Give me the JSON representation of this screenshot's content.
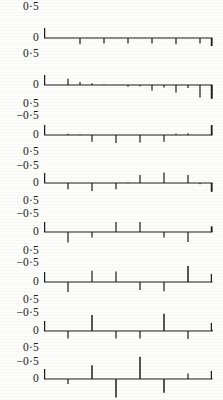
{
  "figure": {
    "type": "multi-panel-stem-plot",
    "panel_count": 8,
    "background_color": "#fdfdfb",
    "ink_color": "#1c1c1c",
    "y_tick_labels": [
      "0·5",
      "0",
      "−0·5"
    ],
    "y_tick_label_top": "0·5",
    "y_tick_label_zero": "0",
    "y_tick_label_bottom": "−0·5",
    "axis_origin_x": 44,
    "axis_end_x": 212
  },
  "chart_data": [
    {
      "type": "bar",
      "title": "Panel 1",
      "xlabel": "",
      "ylabel": "",
      "ylim": [
        -0.5,
        0.5
      ],
      "ytick_values": [
        0.5,
        0,
        -0.5
      ],
      "ytick_labels": [
        "0·5",
        "0",
        "−0·5"
      ],
      "grid": false,
      "legend": "none",
      "show_negative_axis": false,
      "x": [
        1,
        2,
        3,
        4,
        5,
        6,
        7,
        8,
        9,
        10,
        11,
        12,
        13,
        14
      ],
      "values": [
        0.0,
        0.0,
        -0.1,
        0.0,
        -0.09,
        0.0,
        -0.09,
        0.0,
        -0.09,
        0.0,
        -0.1,
        0.0,
        -0.09,
        -0.13
      ]
    },
    {
      "type": "bar",
      "title": "Panel 2",
      "xlabel": "",
      "ylabel": "",
      "ylim": [
        -0.5,
        0.5
      ],
      "ytick_values": [
        0.5,
        0,
        -0.5
      ],
      "ytick_labels": [
        "0·5",
        "0",
        "−0·5"
      ],
      "grid": false,
      "legend": "none",
      "show_negative_axis": true,
      "x": [
        1,
        2,
        3,
        4,
        5,
        6,
        7,
        8,
        9,
        10,
        11,
        12,
        13,
        14
      ],
      "values": [
        0.0,
        0.1,
        0.05,
        0.03,
        0.01,
        0.0,
        -0.03,
        -0.02,
        -0.09,
        -0.04,
        -0.12,
        -0.05,
        -0.2,
        -0.22
      ]
    },
    {
      "type": "bar",
      "title": "Panel 3",
      "xlabel": "",
      "ylabel": "",
      "ylim": [
        -0.5,
        0.5
      ],
      "ytick_values": [
        0.5,
        0,
        -0.5
      ],
      "ytick_labels": [
        "0·5",
        "0",
        "−0·5"
      ],
      "grid": false,
      "legend": "none",
      "show_negative_axis": true,
      "x": [
        1,
        2,
        3,
        4,
        5,
        6,
        7,
        8,
        9,
        10,
        11,
        12,
        13,
        14
      ],
      "values": [
        0.0,
        0.02,
        0.01,
        -0.11,
        0.0,
        -0.13,
        0.0,
        -0.12,
        0.0,
        -0.11,
        0.02,
        0.03,
        0.0,
        0.16
      ]
    },
    {
      "type": "bar",
      "title": "Panel 4",
      "xlabel": "",
      "ylabel": "",
      "ylim": [
        -0.5,
        0.5
      ],
      "ytick_values": [
        0.5,
        0,
        -0.5
      ],
      "ytick_labels": [
        "0·5",
        "0",
        "−0·5"
      ],
      "grid": false,
      "legend": "none",
      "show_negative_axis": true,
      "x": [
        1,
        2,
        3,
        4,
        5,
        6,
        7,
        8,
        9,
        10,
        11,
        12,
        13,
        14
      ],
      "values": [
        0.0,
        -0.1,
        0.0,
        -0.13,
        0.0,
        -0.1,
        0.01,
        0.13,
        0.0,
        0.17,
        0.0,
        0.13,
        -0.02,
        -0.14
      ]
    },
    {
      "type": "bar",
      "title": "Panel 5",
      "xlabel": "",
      "ylabel": "",
      "ylim": [
        -0.5,
        0.5
      ],
      "ytick_values": [
        0.5,
        0,
        -0.5
      ],
      "ytick_labels": [
        "0·5",
        "0",
        "−0·5"
      ],
      "grid": false,
      "legend": "none",
      "show_negative_axis": true,
      "x": [
        1,
        2,
        3,
        4,
        5,
        6,
        7,
        8,
        9,
        10,
        11,
        12,
        13,
        14
      ],
      "values": [
        0.0,
        -0.17,
        0.0,
        -0.09,
        0.0,
        0.16,
        0.0,
        0.16,
        0.0,
        -0.09,
        0.0,
        -0.16,
        0.0,
        0.09
      ]
    },
    {
      "type": "bar",
      "title": "Panel 6",
      "xlabel": "",
      "ylabel": "",
      "ylim": [
        -0.5,
        0.5
      ],
      "ytick_values": [
        0.5,
        0,
        -0.5
      ],
      "ytick_labels": [
        "0·5",
        "0",
        "−0·5"
      ],
      "grid": false,
      "legend": "none",
      "show_negative_axis": true,
      "x": [
        1,
        2,
        3,
        4,
        5,
        6,
        7,
        8,
        9,
        10,
        11,
        12,
        13,
        14
      ],
      "values": [
        0.0,
        -0.16,
        0.0,
        0.18,
        0.0,
        0.17,
        0.0,
        -0.13,
        0.0,
        -0.15,
        0.0,
        0.26,
        0.0,
        0.0
      ]
    },
    {
      "type": "bar",
      "title": "Panel 7",
      "xlabel": "",
      "ylabel": "",
      "ylim": [
        -0.5,
        0.5
      ],
      "ytick_values": [
        0.5,
        0,
        -0.5
      ],
      "ytick_labels": [
        "0·5",
        "0",
        "−0·5"
      ],
      "grid": false,
      "legend": "none",
      "show_negative_axis": true,
      "x": [
        1,
        2,
        3,
        4,
        5,
        6,
        7,
        8,
        9,
        10,
        11,
        12,
        13,
        14
      ],
      "values": [
        0.0,
        -0.12,
        0.0,
        0.26,
        0.0,
        -0.12,
        0.0,
        -0.12,
        0.0,
        0.28,
        0.0,
        -0.13,
        0.0,
        0.02
      ]
    },
    {
      "type": "bar",
      "title": "Panel 8",
      "xlabel": "",
      "ylabel": "",
      "ylim": [
        -0.5,
        0.5
      ],
      "ytick_values": [
        0.5,
        0,
        -0.5
      ],
      "ytick_labels": [
        "0·5",
        "0",
        "−0·5"
      ],
      "grid": false,
      "legend": "none",
      "show_negative_axis": true,
      "x": [
        1,
        2,
        3,
        4,
        5,
        6,
        7,
        8,
        9,
        10,
        11,
        12,
        13,
        14
      ],
      "values": [
        0.0,
        -0.08,
        0.0,
        0.22,
        0.0,
        -0.3,
        0.0,
        0.36,
        0.0,
        -0.22,
        0.0,
        0.09,
        0.0,
        0.0
      ]
    }
  ]
}
